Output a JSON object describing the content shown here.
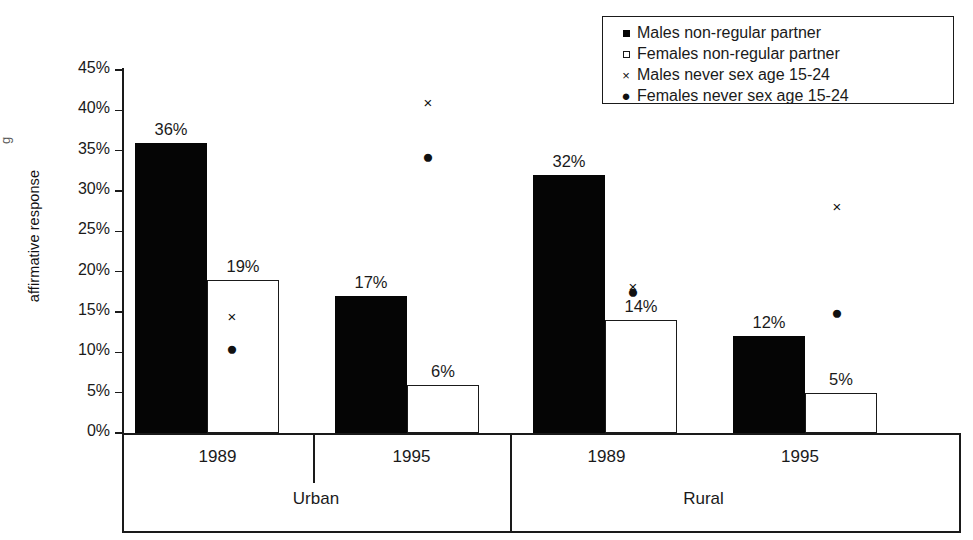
{
  "chart_data": {
    "type": "bar",
    "title": "",
    "subtitle": "",
    "xlabel": "",
    "ylabel": "affirmative response",
    "ylim": [
      0,
      45
    ],
    "ytick_labels": [
      "45%",
      "40%",
      "35%",
      "30%",
      "25%",
      "20%",
      "15%",
      "10%",
      "5%",
      "0%"
    ],
    "ytick_values": [
      45,
      40,
      35,
      30,
      25,
      20,
      15,
      10,
      5,
      0
    ],
    "grid": false,
    "legend_position": "top-right",
    "categories": [
      "1989",
      "1995",
      "1989",
      "1995"
    ],
    "group_labels": [
      "Urban",
      "Rural"
    ],
    "series": [
      {
        "name": "Males non-regular partner",
        "marker": "filled-square",
        "style": "bar-solid",
        "values": [
          36,
          17,
          32,
          12
        ],
        "data_labels": [
          "36%",
          "17%",
          "32%",
          "12%"
        ]
      },
      {
        "name": "Females non-regular partner",
        "marker": "hollow-square",
        "style": "bar-hollow",
        "values": [
          19,
          6,
          14,
          5
        ],
        "data_labels": [
          "19%",
          "6%",
          "14%",
          "5%"
        ]
      },
      {
        "name": "Males never sex age 15-24",
        "marker": "cross",
        "style": "scatter",
        "values": [
          14.5,
          41,
          18.2,
          28.2
        ],
        "data_labels": [
          "",
          "",
          "",
          ""
        ]
      },
      {
        "name": "Females never sex age 15-24",
        "marker": "filled-circle",
        "style": "scatter",
        "values": [
          10.5,
          34.3,
          17.6,
          15
        ],
        "data_labels": [
          "",
          "",
          "",
          ""
        ]
      }
    ]
  },
  "axis": {
    "y_title": "affirmative response",
    "y_title_stub": "g"
  },
  "legend": {
    "items": [
      {
        "label": "Males non-regular partner",
        "glyph": "filled-square-icon"
      },
      {
        "label": "Females non-regular partner",
        "glyph": "hollow-square-icon"
      },
      {
        "label": "Males never sex age 15-24",
        "glyph": "cross-icon",
        "char": "×"
      },
      {
        "label": "Females never sex age 15-24",
        "glyph": "filled-circle-icon",
        "char": "●"
      }
    ]
  },
  "xaxis": {
    "year_labels": [
      "1989",
      "1995",
      "1989",
      "1995"
    ],
    "region_labels": [
      "Urban",
      "Rural"
    ]
  },
  "markers": {
    "cross_char": "×",
    "dot_char": "●"
  },
  "colors": {
    "ink": "#1a1a1a",
    "bar_solid": "#050505",
    "bar_hollow_fill": "#ffffff",
    "background": "#ffffff"
  }
}
